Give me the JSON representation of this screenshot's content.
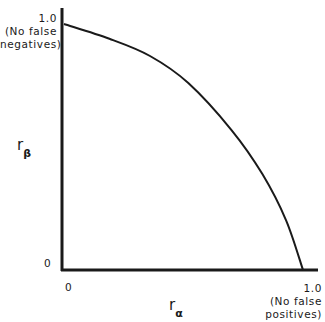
{
  "chart_data": {
    "type": "line",
    "title": "",
    "xlabel": "r_α",
    "ylabel": "r_β",
    "xlim": [
      0,
      1
    ],
    "ylim": [
      0,
      1
    ],
    "grid": false,
    "legend": null,
    "series": [
      {
        "name": "tradeoff curve",
        "x": [
          0.0,
          0.19,
          0.36,
          0.52,
          0.7,
          0.83,
          0.93,
          1.0
        ],
        "y": [
          1.0,
          0.94,
          0.87,
          0.76,
          0.57,
          0.39,
          0.2,
          0.0
        ]
      }
    ],
    "x_ticks": [
      {
        "value": 0,
        "label": "0"
      },
      {
        "value": 1.0,
        "label": "1.0",
        "note": "(No false positives)"
      }
    ],
    "y_ticks": [
      {
        "value": 0,
        "label": "0"
      },
      {
        "value": 1.0,
        "label": "1.0",
        "note": "(No false negatives)"
      }
    ]
  },
  "labels": {
    "y_top_value": "1.0",
    "y_top_note_1": "(No false",
    "y_top_note_2": "negatives)",
    "y_zero": "0",
    "x_zero": "0",
    "x_right_value": "1.0",
    "x_right_note_1": "(No false",
    "x_right_note_2": "positives)",
    "y_axis_r": "r",
    "y_axis_sub": "β",
    "x_axis_r": "r",
    "x_axis_sub": "α"
  },
  "colors": {
    "line": "#1a1a1a",
    "background": "#ffffff"
  }
}
